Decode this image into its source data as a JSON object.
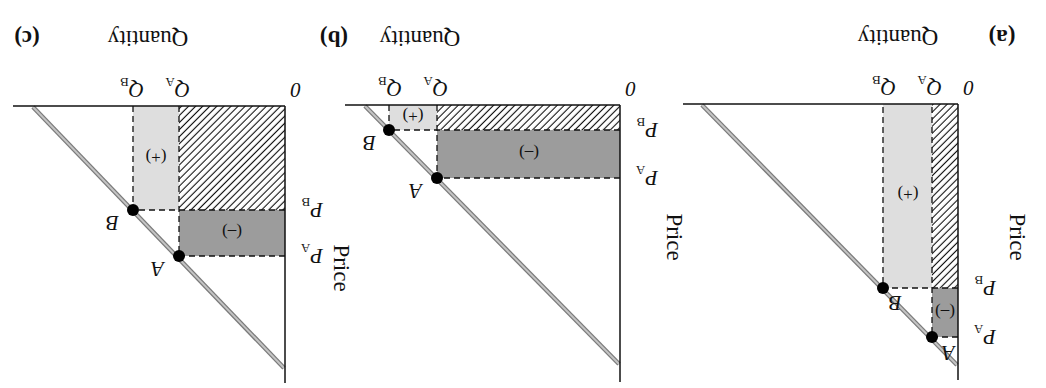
{
  "figure": {
    "orientation": "rotated 180 degrees",
    "colors": {
      "loss_fill": "#9c9c9c",
      "gain_fill": "#dedede",
      "hatch": "#111111",
      "demand_line": "#a8a8a8",
      "axis": "#111111",
      "point": "#000000"
    },
    "panels": [
      {
        "id": "a",
        "label": "(a)",
        "x_axis_label": "Quantity",
        "y_axis_label": "Price",
        "origin_label": "0",
        "q_a": "Q",
        "q_a_sub": "A",
        "q_b": "Q",
        "q_b_sub": "B",
        "p_a": "P",
        "p_a_sub": "A",
        "p_b": "P",
        "p_b_sub": "B",
        "point_a": "A",
        "point_b": "B",
        "gain_label": "(+)",
        "loss_label": "(–)"
      },
      {
        "id": "b",
        "label": "(b)",
        "x_axis_label": "Quantity",
        "y_axis_label": "Price",
        "origin_label": "0",
        "q_a": "Q",
        "q_a_sub": "A",
        "q_b": "Q",
        "q_b_sub": "B",
        "p_a": "P",
        "p_a_sub": "A",
        "p_b": "P",
        "p_b_sub": "B",
        "point_a": "A",
        "point_b": "B",
        "gain_label": "(+)",
        "loss_label": "(–)"
      },
      {
        "id": "c",
        "label": "(c)",
        "x_axis_label": "Quantity",
        "y_axis_label": "Price",
        "origin_label": "0",
        "q_a": "Q",
        "q_a_sub": "A",
        "q_b": "Q",
        "q_b_sub": "B",
        "p_a": "P",
        "p_a_sub": "A",
        "p_b": "P",
        "p_b_sub": "B",
        "point_a": "A",
        "point_b": "B",
        "gain_label": "(+)",
        "loss_label": "(–)"
      }
    ]
  }
}
